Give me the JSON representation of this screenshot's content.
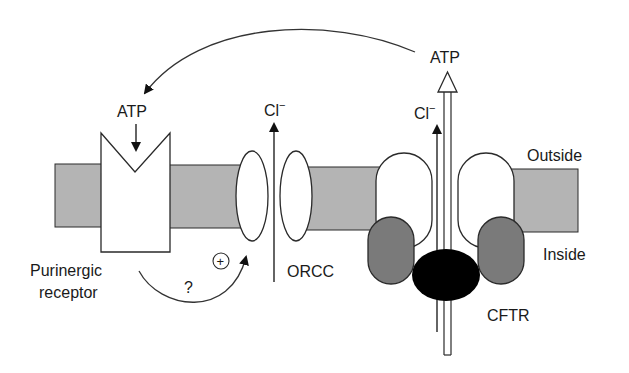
{
  "diagram": {
    "colors": {
      "membrane": "#b4b4b4",
      "subunit_dark": "#7a7a7a",
      "nbd_black": "#000000",
      "stroke": "#2a2a2a",
      "background": "#ffffff"
    },
    "labels": {
      "atp_top": "ATP",
      "atp_receptor": "ATP",
      "cl_orcc": "Cl",
      "cl_orcc_charge": "−",
      "cl_cftr": "Cl",
      "cl_cftr_charge": "−",
      "outside": "Outside",
      "inside": "Inside",
      "purinergic_line1": "Purinergic",
      "purinergic_line2": "receptor",
      "question": "?",
      "plus": "+",
      "orcc": "ORCC",
      "cftr": "CFTR"
    },
    "components": [
      {
        "id": "purinergic-receptor",
        "label": "Purinergic receptor"
      },
      {
        "id": "orcc",
        "label": "ORCC"
      },
      {
        "id": "cftr",
        "label": "CFTR"
      }
    ],
    "connections": [
      {
        "from": "cftr",
        "to": "purinergic-receptor",
        "label": "ATP",
        "type": "curved-arrow"
      },
      {
        "from": "purinergic-receptor",
        "to": "orcc",
        "label": "?",
        "annotation": "+",
        "type": "curved-arrow"
      }
    ]
  }
}
